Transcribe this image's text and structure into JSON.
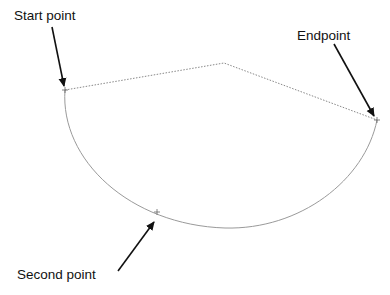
{
  "diagram": {
    "type": "three-point-arc",
    "labels": {
      "start": "Start point",
      "end": "Endpoint",
      "second": "Second point"
    },
    "points": {
      "start": [
        65,
        90
      ],
      "apex": [
        224,
        63
      ],
      "end": [
        377,
        120
      ],
      "second": [
        157,
        212
      ]
    },
    "colors": {
      "arc": "#9a9a9a",
      "construction": "#7a7a7a",
      "arrow": "#111111",
      "text": "#111111"
    }
  }
}
